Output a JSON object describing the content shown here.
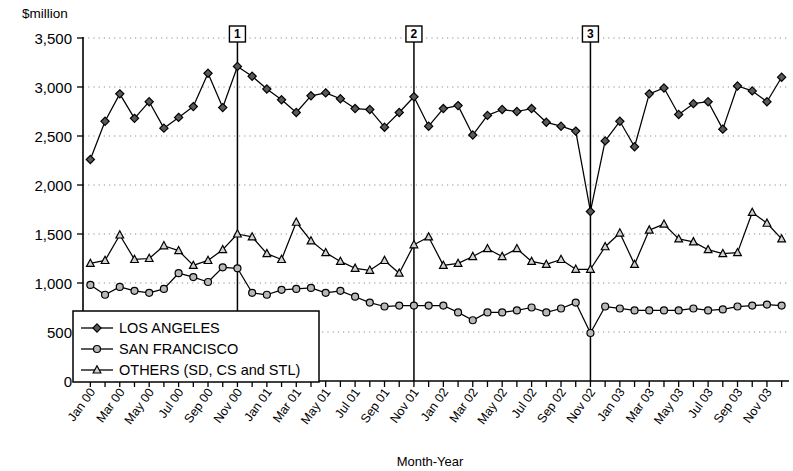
{
  "chart_data": {
    "type": "line",
    "title": "",
    "ylabel": "$million",
    "xlabel": "Month-Year",
    "ylim": [
      0,
      3500
    ],
    "ytick_step": 500,
    "grid": true,
    "legend_position": "lower-left-inside",
    "ytick_labels": [
      "0",
      "500",
      "1,000",
      "1,500",
      "2,000",
      "2,500",
      "3,000",
      "3,500"
    ],
    "ytick_values": [
      0,
      500,
      1000,
      1500,
      2000,
      2500,
      3000,
      3500
    ],
    "x": [
      "Jan 00",
      "Feb 00",
      "Mar 00",
      "Apr 00",
      "May 00",
      "Jun 00",
      "Jul 00",
      "Aug 00",
      "Sep 00",
      "Oct 00",
      "Nov 00",
      "Dec 00",
      "Jan 01",
      "Feb 01",
      "Mar 01",
      "Apr 01",
      "May 01",
      "Jun 01",
      "Jul 01",
      "Aug 01",
      "Sep 01",
      "Oct 01",
      "Nov 01",
      "Dec 01",
      "Jan 02",
      "Feb 02",
      "Mar 02",
      "Apr 02",
      "May 02",
      "Jun 02",
      "Jul 02",
      "Aug 02",
      "Sep 02",
      "Oct 02",
      "Nov 02",
      "Dec 02",
      "Jan 03",
      "Feb 03",
      "Mar 03",
      "Apr 03",
      "May 03",
      "Jun 03",
      "Jul 03",
      "Aug 03",
      "Sep 03",
      "Oct 03",
      "Nov 03",
      "Dec 03"
    ],
    "xtick_labels": [
      "Jan 00",
      "Mar 00",
      "May 00",
      "Jul 00",
      "Sep 00",
      "Nov 00",
      "Jan 01",
      "Mar 01",
      "May 01",
      "Jul 01",
      "Sep 01",
      "Nov 01",
      "Jan 02",
      "Mar 02",
      "May 02",
      "Jul 02",
      "Sep 02",
      "Nov 02",
      "Jan 03",
      "Mar 03",
      "May 03",
      "Jul 03",
      "Sep 03",
      "Nov 03"
    ],
    "series": [
      {
        "name": "LOS ANGELES",
        "marker": "diamond",
        "values": [
          2260,
          2650,
          2930,
          2680,
          2850,
          2580,
          2690,
          2800,
          3140,
          2790,
          3210,
          3110,
          2980,
          2870,
          2740,
          2910,
          2940,
          2880,
          2780,
          2770,
          2590,
          2740,
          2900,
          2600,
          2780,
          2810,
          2510,
          2710,
          2770,
          2750,
          2780,
          2640,
          2600,
          2550,
          1730,
          2450,
          2650,
          2390,
          2930,
          2990,
          2720,
          2830,
          2850,
          2570,
          3010,
          2960,
          2850,
          3100
        ]
      },
      {
        "name": "SAN FRANCISCO",
        "marker": "circle",
        "values": [
          980,
          880,
          960,
          920,
          900,
          940,
          1100,
          1060,
          1010,
          1160,
          1150,
          900,
          880,
          930,
          940,
          950,
          900,
          920,
          860,
          800,
          760,
          770,
          770,
          770,
          770,
          700,
          620,
          700,
          700,
          720,
          750,
          700,
          740,
          800,
          490,
          760,
          740,
          720,
          720,
          720,
          720,
          740,
          720,
          730,
          760,
          770,
          780,
          770
        ]
      },
      {
        "name": "OTHERS (SD, CS and STL)",
        "marker": "triangle",
        "values": [
          1200,
          1230,
          1490,
          1240,
          1250,
          1380,
          1330,
          1180,
          1230,
          1340,
          1500,
          1470,
          1300,
          1240,
          1620,
          1430,
          1310,
          1220,
          1150,
          1130,
          1230,
          1100,
          1390,
          1470,
          1180,
          1200,
          1270,
          1350,
          1270,
          1350,
          1220,
          1190,
          1240,
          1140,
          1140,
          1370,
          1510,
          1190,
          1540,
          1600,
          1450,
          1420,
          1340,
          1300,
          1310,
          1720,
          1610,
          1450
        ]
      }
    ],
    "event_markers": [
      {
        "label": "1",
        "x": "Nov 00"
      },
      {
        "label": "2",
        "x": "Nov 01"
      },
      {
        "label": "3",
        "x": "Nov 02"
      }
    ]
  }
}
